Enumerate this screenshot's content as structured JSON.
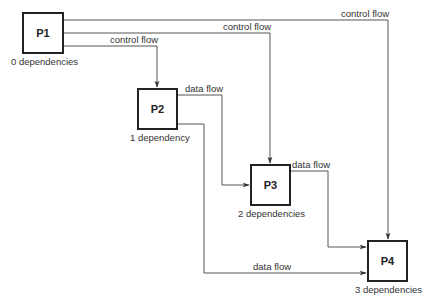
{
  "diagram": {
    "type": "process dependency graph",
    "nodes": [
      {
        "id": "P1",
        "label": "P1",
        "dependencies_label": "0 dependencies"
      },
      {
        "id": "P2",
        "label": "P2",
        "dependencies_label": "1 dependency"
      },
      {
        "id": "P3",
        "label": "P3",
        "dependencies_label": "2 dependencies"
      },
      {
        "id": "P4",
        "label": "P4",
        "dependencies_label": "3 dependencies"
      }
    ],
    "edges": [
      {
        "from": "P1",
        "to": "P4",
        "label": "control flow"
      },
      {
        "from": "P1",
        "to": "P3",
        "label": "control flow"
      },
      {
        "from": "P1",
        "to": "P2",
        "label": "control flow"
      },
      {
        "from": "P2",
        "to": "P3",
        "label": "data flow"
      },
      {
        "from": "P2",
        "to": "P4",
        "label": "data flow"
      },
      {
        "from": "P3",
        "to": "P4",
        "label": "data flow"
      }
    ],
    "colors": {
      "line": "#444444",
      "box_border": "#222222",
      "background": "#ffffff"
    }
  }
}
